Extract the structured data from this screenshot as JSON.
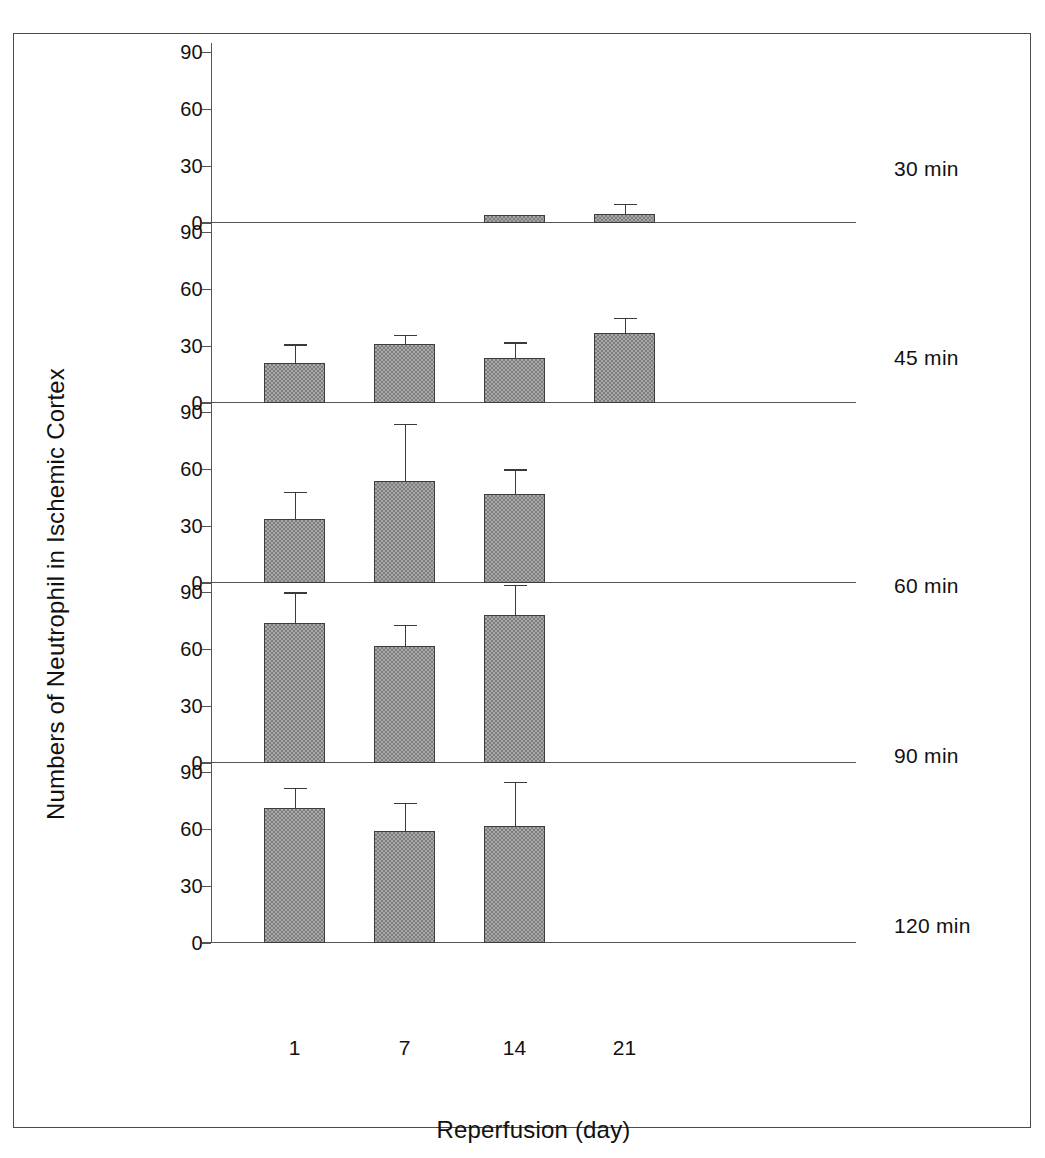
{
  "figure": {
    "ylabel": "Numbers of Neutrophil in Ischemic Cortex",
    "xlabel": "Reperfusion (day)"
  },
  "axis": {
    "yticks": [
      "0",
      "30",
      "60",
      "90"
    ],
    "ytick_values": [
      0,
      30,
      60,
      90
    ],
    "xticks": [
      "1",
      "7",
      "14",
      "21"
    ]
  },
  "chart_data": {
    "type": "bar",
    "title": "",
    "subtitle": "",
    "xlabel": "Reperfusion (day)",
    "ylabel": "Numbers of Neutrophil in Ischemic Cortex",
    "categories": [
      "1",
      "7",
      "14",
      "21"
    ],
    "x": [
      1,
      7,
      14,
      21
    ],
    "ylim": [
      0,
      95
    ],
    "yticks": [
      0,
      30,
      60,
      90
    ],
    "grid": false,
    "legend": "none",
    "layout": "5 stacked panels sharing one x axis; each panel annotated at right with ischemia duration",
    "error_bars": "upper SEM whisker only",
    "panels": [
      {
        "label": "30 min",
        "values": [
          null,
          null,
          4,
          5
        ],
        "errors": [
          null,
          null,
          0,
          5
        ]
      },
      {
        "label": "45 min",
        "values": [
          21,
          31,
          24,
          37
        ],
        "errors": [
          10,
          5,
          8,
          8
        ]
      },
      {
        "label": "60 min",
        "values": [
          34,
          54,
          47,
          null
        ],
        "errors": [
          14,
          30,
          13,
          null
        ]
      },
      {
        "label": "90 min",
        "values": [
          74,
          62,
          78,
          null
        ],
        "errors": [
          16,
          11,
          16,
          null
        ]
      },
      {
        "label": "120 min",
        "values": [
          71,
          59,
          62,
          null
        ],
        "errors": [
          11,
          15,
          23,
          null
        ]
      }
    ],
    "series": [
      {
        "name": "30 min",
        "values": [
          null,
          null,
          4,
          5
        ]
      },
      {
        "name": "45 min",
        "values": [
          21,
          31,
          24,
          37
        ]
      },
      {
        "name": "60 min",
        "values": [
          34,
          54,
          47,
          null
        ]
      },
      {
        "name": "90 min",
        "values": [
          74,
          62,
          78,
          null
        ]
      },
      {
        "name": "120 min",
        "values": [
          71,
          59,
          62,
          null
        ]
      }
    ]
  },
  "colors": {
    "bar_fill": "#a8a8a8",
    "bar_hatch": "#7e7e7e",
    "bar_edge": "#3d3d3d",
    "axis": "#555555",
    "text": "#111111",
    "background": "#ffffff"
  }
}
